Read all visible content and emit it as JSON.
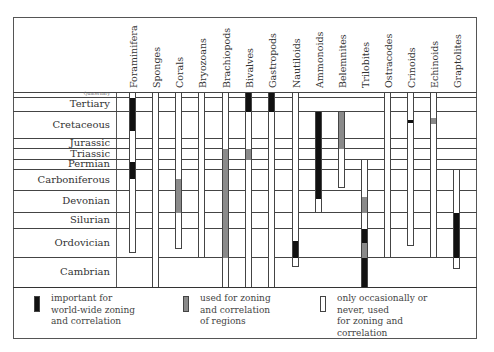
{
  "chart_data": {
    "type": "table",
    "title": "",
    "layout": {
      "frame": {
        "left": 13,
        "right": 476,
        "top": 17,
        "header_bottom": 92,
        "chart_bottom": 287,
        "legend_bottom": 338
      },
      "label_column_right": 116
    },
    "periods": [
      {
        "name": "Quaternary",
        "top": 92,
        "bottom": 97,
        "small": true
      },
      {
        "name": "Tertiary",
        "top": 97,
        "bottom": 111
      },
      {
        "name": "Cretaceous",
        "top": 111,
        "bottom": 138
      },
      {
        "name": "Jurassic",
        "top": 138,
        "bottom": 148
      },
      {
        "name": "Triassic",
        "top": 148,
        "bottom": 159
      },
      {
        "name": "Permian",
        "top": 159,
        "bottom": 169
      },
      {
        "name": "Carboniferous",
        "top": 169,
        "bottom": 190
      },
      {
        "name": "Devonian",
        "top": 190,
        "bottom": 212
      },
      {
        "name": "Silurian",
        "top": 212,
        "bottom": 228
      },
      {
        "name": "Ordovician",
        "top": 228,
        "bottom": 257
      },
      {
        "name": "Cambrian",
        "top": 257,
        "bottom": 287
      }
    ],
    "groups": [
      {
        "name": "Foraminifera",
        "x": 129,
        "range": [
          92,
          252
        ],
        "segments": [
          {
            "from": 97,
            "to": 130,
            "use": "important"
          },
          {
            "from": 161,
            "to": 178,
            "use": "important"
          }
        ]
      },
      {
        "name": "Sponges",
        "x": 152,
        "range": [
          92,
          287
        ],
        "segments": []
      },
      {
        "name": "Corals",
        "x": 175,
        "range": [
          92,
          248
        ],
        "segments": [
          {
            "from": 178,
            "to": 212,
            "use": "regional"
          }
        ]
      },
      {
        "name": "Bryozoans",
        "x": 198,
        "range": [
          92,
          257
        ],
        "segments": []
      },
      {
        "name": "Brachiopods",
        "x": 222,
        "range": [
          92,
          287
        ],
        "segments": [
          {
            "from": 148,
            "to": 257,
            "use": "regional"
          }
        ]
      },
      {
        "name": "Bivalves",
        "x": 245,
        "range": [
          92,
          287
        ],
        "segments": [
          {
            "from": 92,
            "to": 111,
            "use": "important"
          },
          {
            "from": 148,
            "to": 159,
            "use": "regional"
          }
        ]
      },
      {
        "name": "Gastropods",
        "x": 268,
        "range": [
          92,
          287
        ],
        "segments": [
          {
            "from": 92,
            "to": 111,
            "use": "important"
          }
        ]
      },
      {
        "name": "Nautiloids",
        "x": 292,
        "range": [
          92,
          266
        ],
        "segments": [
          {
            "from": 240,
            "to": 257,
            "use": "important"
          }
        ]
      },
      {
        "name": "Ammonoids",
        "x": 315,
        "range": [
          111,
          212
        ],
        "segments": [
          {
            "from": 111,
            "to": 198,
            "use": "important"
          }
        ]
      },
      {
        "name": "Belemnites",
        "x": 338,
        "range": [
          111,
          187
        ],
        "segments": [
          {
            "from": 111,
            "to": 148,
            "use": "regional"
          }
        ]
      },
      {
        "name": "Trilobites",
        "x": 361,
        "range": [
          159,
          287
        ],
        "segments": [
          {
            "from": 196,
            "to": 212,
            "use": "regional"
          },
          {
            "from": 228,
            "to": 242,
            "use": "important"
          },
          {
            "from": 242,
            "to": 257,
            "use": "regional"
          },
          {
            "from": 257,
            "to": 287,
            "use": "important"
          }
        ]
      },
      {
        "name": "Ostracodes",
        "x": 384,
        "range": [
          92,
          257
        ],
        "segments": []
      },
      {
        "name": "Crinoids",
        "x": 407,
        "range": [
          92,
          245
        ],
        "segments": [
          {
            "from": 119,
            "to": 122,
            "use": "important"
          }
        ]
      },
      {
        "name": "Echinoids",
        "x": 430,
        "range": [
          92,
          257
        ],
        "segments": [
          {
            "from": 117,
            "to": 123,
            "use": "regional"
          }
        ]
      },
      {
        "name": "Graptolites",
        "x": 453,
        "range": [
          169,
          268
        ],
        "segments": [
          {
            "from": 212,
            "to": 257,
            "use": "important"
          }
        ]
      }
    ],
    "legend": [
      {
        "key": "important",
        "color": "#111111",
        "label": "important for\nworld-wide zoning\nand correlation"
      },
      {
        "key": "regional",
        "color": "#8a8a8a",
        "label": "used for zoning\nand correlation\nof regions"
      },
      {
        "key": "occasional",
        "color": "#ffffff",
        "label": "only occasionally or\nnever, used\nfor zoning and\ncorrelation"
      }
    ]
  }
}
